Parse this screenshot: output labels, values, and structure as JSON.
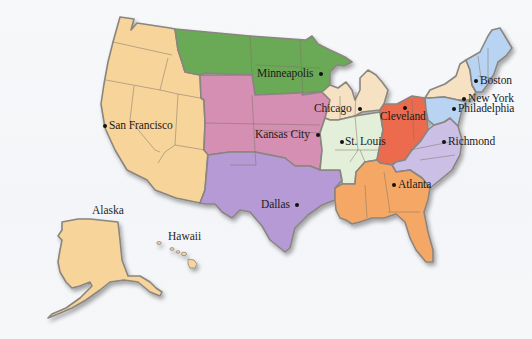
{
  "map": {
    "title": "Federal Reserve Districts",
    "colors": {
      "background": "#f6f7f9",
      "border": "#8a8580",
      "san_francisco": "#f7d49a",
      "minneapolis": "#6aa956",
      "kansas_city": "#d48fb2",
      "dallas": "#b59ad6",
      "chicago": "#f6e2c2",
      "st_louis": "#e3efd9",
      "cleveland": "#ec6a4e",
      "richmond": "#cbbfe6",
      "atlanta": "#f5a866",
      "new_york": "#f6e2c2",
      "philadelphia": "#b9d4f2",
      "boston": "#b9d4f2"
    },
    "districts": [
      {
        "id": "boston",
        "city": "Boston"
      },
      {
        "id": "new_york",
        "city": "New York"
      },
      {
        "id": "philadelphia",
        "city": "Philadelphia"
      },
      {
        "id": "cleveland",
        "city": "Cleveland"
      },
      {
        "id": "richmond",
        "city": "Richmond"
      },
      {
        "id": "atlanta",
        "city": "Atlanta"
      },
      {
        "id": "chicago",
        "city": "Chicago"
      },
      {
        "id": "st_louis",
        "city": "St. Louis"
      },
      {
        "id": "minneapolis",
        "city": "Minneapolis"
      },
      {
        "id": "kansas_city",
        "city": "Kansas City"
      },
      {
        "id": "dallas",
        "city": "Dallas"
      },
      {
        "id": "san_francisco",
        "city": "San Francisco"
      }
    ],
    "region_labels": {
      "alaska": "Alaska",
      "hawaii": "Hawaii"
    }
  }
}
